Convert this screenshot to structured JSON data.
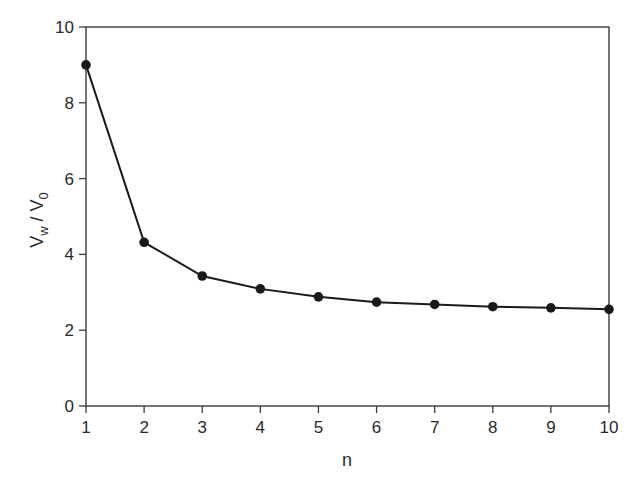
{
  "chart_data": {
    "type": "line",
    "title": "",
    "xlabel": "n",
    "ylabel": "V_w / V_0",
    "ylabel_parts": {
      "main1": "V",
      "sub1": "w",
      "sep": " / ",
      "main2": "V",
      "sub2": "0"
    },
    "x": [
      1,
      2,
      3,
      4,
      5,
      6,
      7,
      8,
      9,
      10
    ],
    "series": [
      {
        "name": "V_w / V_0",
        "values": [
          9.0,
          4.32,
          3.43,
          3.09,
          2.88,
          2.74,
          2.68,
          2.62,
          2.59,
          2.55
        ],
        "marker": "filled-circle",
        "color": "#1a1a1a"
      }
    ],
    "xlim": [
      1,
      10
    ],
    "ylim": [
      0,
      10
    ],
    "xticks": [
      1,
      2,
      3,
      4,
      5,
      6,
      7,
      8,
      9,
      10
    ],
    "yticks": [
      0,
      2,
      4,
      6,
      8,
      10
    ],
    "grid": false,
    "legend": null,
    "frame": "box"
  },
  "colors": {
    "axis": "#3a3a3a",
    "line": "#1a1a1a",
    "text": "#2a2a2a",
    "background": "#ffffff"
  }
}
